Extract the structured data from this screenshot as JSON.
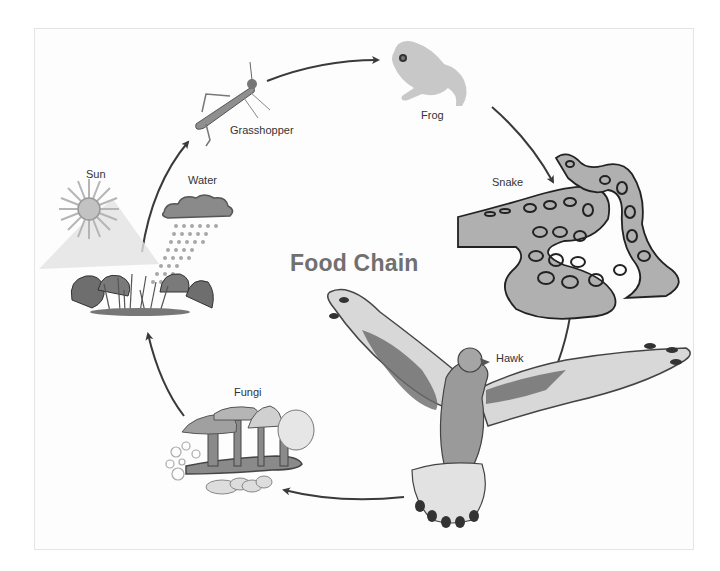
{
  "diagram": {
    "title": "Food Chain",
    "nodes": [
      {
        "id": "sun",
        "label": "Sun",
        "icon": "sun-icon"
      },
      {
        "id": "water",
        "label": "Water",
        "icon": "rain-cloud-icon"
      },
      {
        "id": "plants",
        "label": "",
        "icon": "plants-icon"
      },
      {
        "id": "grasshopper",
        "label": "Grasshopper",
        "icon": "grasshopper-icon"
      },
      {
        "id": "frog",
        "label": "Frog",
        "icon": "frog-icon"
      },
      {
        "id": "snake",
        "label": "Snake",
        "icon": "snake-icon"
      },
      {
        "id": "hawk",
        "label": "Hawk",
        "icon": "hawk-icon"
      },
      {
        "id": "fungi",
        "label": "Fungi",
        "icon": "mushroom-icon"
      }
    ],
    "edges": [
      {
        "from": "plants",
        "to": "grasshopper"
      },
      {
        "from": "grasshopper",
        "to": "frog"
      },
      {
        "from": "frog",
        "to": "snake"
      },
      {
        "from": "snake",
        "to": "hawk"
      },
      {
        "from": "hawk",
        "to": "fungi"
      },
      {
        "from": "fungi",
        "to": "plants"
      }
    ],
    "colors": {
      "arrow": "#3a3a3a",
      "title": "#707070",
      "label": "#333333",
      "frame": "#e4e4e4"
    }
  }
}
